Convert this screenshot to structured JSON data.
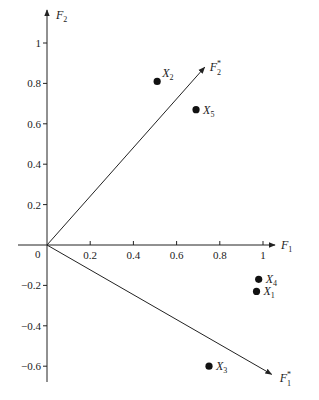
{
  "chart_data": {
    "type": "scatter",
    "title": "",
    "xlabel": "F1",
    "ylabel": "F2",
    "xlim": [
      0,
      1.05
    ],
    "ylim": [
      -0.67,
      1.08
    ],
    "x_ticks": [
      "0.2",
      "0.4",
      "0.6",
      "0.8",
      "1"
    ],
    "y_ticks": [
      "1",
      "0.8",
      "0.6",
      "0.4",
      "0.2",
      "-0.2",
      "-0.4",
      "-0.6"
    ],
    "origin_label": "0",
    "points": [
      {
        "label": "X",
        "sub": "1",
        "x": 0.97,
        "y": -0.23
      },
      {
        "label": "X",
        "sub": "2",
        "x": 0.51,
        "y": 0.81
      },
      {
        "label": "X",
        "sub": "3",
        "x": 0.75,
        "y": -0.6
      },
      {
        "label": "X",
        "sub": "4",
        "x": 0.98,
        "y": -0.17
      },
      {
        "label": "X",
        "sub": "5",
        "x": 0.69,
        "y": 0.67
      }
    ],
    "rotated_axes": [
      {
        "label": "F",
        "sub": "2",
        "sup": "*",
        "end": [
          0.73,
          0.88
        ]
      },
      {
        "label": "F",
        "sub": "1",
        "sup": "*",
        "end": [
          1.04,
          -0.64
        ]
      }
    ],
    "grid": false,
    "legend": "none"
  },
  "axes": {
    "x_label": "F",
    "x_sub": "1",
    "y_label": "F",
    "y_sub": "2"
  }
}
